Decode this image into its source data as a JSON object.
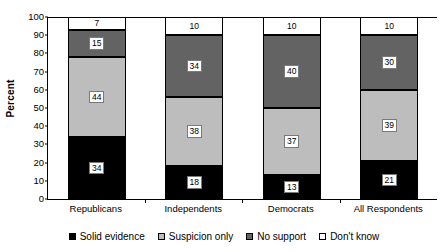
{
  "chart_data": {
    "type": "bar",
    "stacked": true,
    "title": "",
    "xlabel": "",
    "ylabel": "Percent",
    "ylim": [
      0,
      100
    ],
    "ytick_step": 10,
    "yticks": [
      100,
      90,
      80,
      70,
      60,
      50,
      40,
      30,
      20,
      10,
      0
    ],
    "grid": false,
    "legend_position": "bottom",
    "categories": [
      "Republicans",
      "Independents",
      "Democrats",
      "All Respondents"
    ],
    "series": [
      {
        "name": "Solid evidence",
        "color": "#000000",
        "values": [
          34,
          18,
          13,
          21
        ]
      },
      {
        "name": "Suspicion only",
        "color": "#bdbdbd",
        "values": [
          44,
          38,
          37,
          39
        ]
      },
      {
        "name": "No support",
        "color": "#636363",
        "values": [
          15,
          34,
          40,
          30
        ]
      },
      {
        "name": "Don't know",
        "color": "#ffffff",
        "values": [
          7,
          10,
          10,
          10
        ]
      }
    ]
  },
  "axes": {
    "y_title": "Percent"
  },
  "legend": {
    "items": [
      {
        "label": "Solid evidence"
      },
      {
        "label": "Suspicion only"
      },
      {
        "label": "No support"
      },
      {
        "label": "Don't know"
      }
    ]
  }
}
